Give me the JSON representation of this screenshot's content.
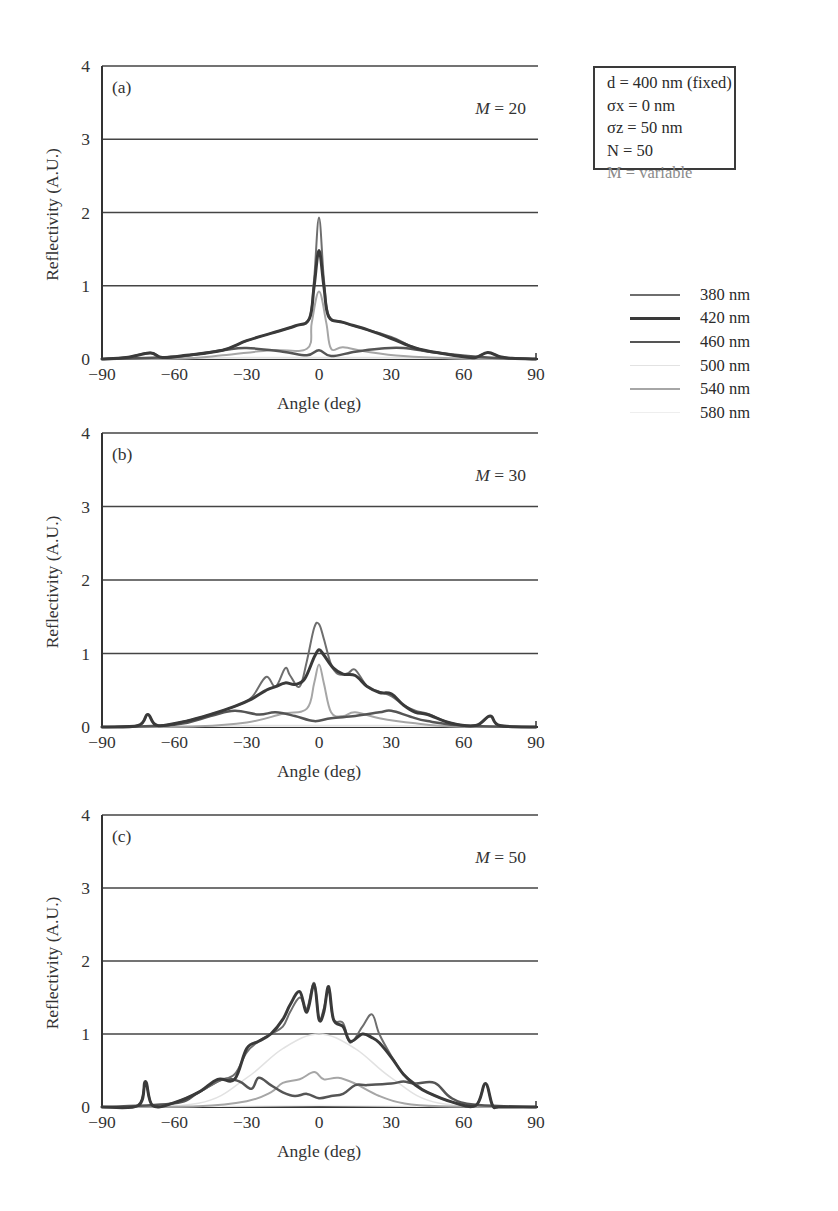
{
  "figure": {
    "parameters": {
      "d": "d = 400 nm (fixed)",
      "sigma_x": "σx = 0 nm",
      "sigma_z": "σz = 50 nm",
      "N": "N = 50",
      "M": "M = variable"
    },
    "legend": [
      {
        "label": "380 nm",
        "color": "#6e6e6e",
        "width": 2
      },
      {
        "label": "420 nm",
        "color": "#3a3a3a",
        "width": 3
      },
      {
        "label": "460 nm",
        "color": "#555555",
        "width": 2.5
      },
      {
        "label": "500 nm",
        "color": "#e2e2e2",
        "width": 1.5
      },
      {
        "label": "540 nm",
        "color": "#a6a6a6",
        "width": 2
      },
      {
        "label": "580 nm",
        "color": "#eeeeee",
        "width": 1.5
      }
    ]
  },
  "chart_data": [
    {
      "type": "line",
      "panel": "(a)",
      "annotation": "M = 20",
      "xlabel": "Angle (deg)",
      "ylabel": "Reflectivity (A.U.)",
      "xlim": [
        -90,
        90
      ],
      "ylim": [
        0,
        4
      ],
      "xticks": [
        -90,
        -60,
        -30,
        0,
        30,
        60,
        90
      ],
      "yticks": [
        0,
        1,
        2,
        3,
        4
      ],
      "grid": "horizontal",
      "series": [
        {
          "name": "380 nm",
          "x": [
            -90,
            -80,
            -70,
            -65,
            -55,
            -40,
            -30,
            -20,
            -10,
            -4,
            -2,
            0,
            2,
            4,
            10,
            20,
            30,
            40,
            50,
            60,
            65,
            70,
            75,
            80,
            90
          ],
          "y": [
            0,
            0.02,
            0.09,
            0.02,
            0.05,
            0.12,
            0.25,
            0.35,
            0.45,
            0.55,
            1.1,
            1.93,
            1.1,
            0.6,
            0.5,
            0.4,
            0.3,
            0.15,
            0.08,
            0.03,
            0.02,
            0.09,
            0.03,
            0.01,
            0
          ]
        },
        {
          "name": "420 nm",
          "x": [
            -90,
            -80,
            -70,
            -65,
            -55,
            -40,
            -30,
            -20,
            -10,
            -4,
            -2,
            0,
            2,
            4,
            10,
            20,
            30,
            40,
            50,
            60,
            65,
            70,
            75,
            80,
            90
          ],
          "y": [
            0,
            0.02,
            0.08,
            0.02,
            0.05,
            0.12,
            0.25,
            0.35,
            0.45,
            0.55,
            1.0,
            1.48,
            1.0,
            0.58,
            0.5,
            0.4,
            0.28,
            0.15,
            0.08,
            0.03,
            0.02,
            0.09,
            0.03,
            0.01,
            0
          ]
        },
        {
          "name": "460 nm",
          "x": [
            -90,
            -60,
            -40,
            -30,
            -15,
            -5,
            0,
            5,
            15,
            25,
            35,
            50,
            70,
            90
          ],
          "y": [
            0,
            0.03,
            0.12,
            0.15,
            0.1,
            0.05,
            0.12,
            0.04,
            0.1,
            0.14,
            0.15,
            0.08,
            0.02,
            0
          ]
        },
        {
          "name": "500 nm",
          "x": [
            -90,
            -50,
            -30,
            0,
            30,
            50,
            90
          ],
          "y": [
            0,
            0.01,
            0.02,
            0.02,
            0.02,
            0.01,
            0
          ]
        },
        {
          "name": "540 nm",
          "x": [
            -90,
            -55,
            -40,
            -20,
            -5,
            -3,
            0,
            3,
            5,
            10,
            20,
            35,
            55,
            90
          ],
          "y": [
            0,
            0.01,
            0.05,
            0.12,
            0.14,
            0.5,
            0.92,
            0.5,
            0.14,
            0.16,
            0.1,
            0.04,
            0.01,
            0
          ]
        },
        {
          "name": "580 nm",
          "x": [
            -90,
            -50,
            0,
            50,
            90
          ],
          "y": [
            0,
            0.01,
            0.01,
            0.01,
            0
          ]
        }
      ]
    },
    {
      "type": "line",
      "panel": "(b)",
      "annotation": "M = 30",
      "xlabel": "Angle (deg)",
      "ylabel": "Reflectivity (A.U.)",
      "xlim": [
        -90,
        90
      ],
      "ylim": [
        0,
        4
      ],
      "xticks": [
        -90,
        -60,
        -30,
        0,
        30,
        60,
        90
      ],
      "yticks": [
        0,
        1,
        2,
        3,
        4
      ],
      "grid": "horizontal",
      "series": [
        {
          "name": "380 nm",
          "x": [
            -90,
            -75,
            -71,
            -67,
            -55,
            -45,
            -35,
            -28,
            -22,
            -18,
            -14,
            -12,
            -8,
            -5,
            -2,
            0,
            2,
            5,
            8,
            12,
            15,
            20,
            25,
            30,
            35,
            40,
            45,
            55,
            65,
            71,
            75,
            90
          ],
          "y": [
            0,
            0.02,
            0.17,
            0.02,
            0.08,
            0.17,
            0.28,
            0.4,
            0.68,
            0.55,
            0.8,
            0.7,
            0.55,
            0.9,
            1.35,
            1.4,
            1.2,
            0.85,
            0.72,
            0.73,
            0.78,
            0.55,
            0.48,
            0.42,
            0.3,
            0.22,
            0.18,
            0.05,
            0.02,
            0.15,
            0.02,
            0
          ]
        },
        {
          "name": "420 nm",
          "x": [
            -90,
            -75,
            -71,
            -67,
            -55,
            -45,
            -35,
            -28,
            -22,
            -18,
            -14,
            -10,
            -6,
            -2,
            0,
            2,
            6,
            10,
            15,
            20,
            25,
            30,
            35,
            40,
            45,
            55,
            65,
            71,
            75,
            90
          ],
          "y": [
            0,
            0.02,
            0.17,
            0.02,
            0.08,
            0.17,
            0.28,
            0.38,
            0.5,
            0.55,
            0.6,
            0.58,
            0.65,
            0.95,
            1.05,
            0.98,
            0.8,
            0.72,
            0.7,
            0.55,
            0.47,
            0.45,
            0.3,
            0.2,
            0.17,
            0.05,
            0.02,
            0.15,
            0.02,
            0
          ]
        },
        {
          "name": "460 nm",
          "x": [
            -90,
            -60,
            -45,
            -35,
            -25,
            -18,
            -10,
            -2,
            5,
            15,
            25,
            30,
            38,
            45,
            60,
            90
          ],
          "y": [
            0,
            0.03,
            0.15,
            0.22,
            0.17,
            0.2,
            0.15,
            0.08,
            0.12,
            0.15,
            0.2,
            0.22,
            0.14,
            0.08,
            0.02,
            0
          ]
        },
        {
          "name": "500 nm",
          "x": [
            -90,
            -50,
            -30,
            0,
            30,
            50,
            90
          ],
          "y": [
            0,
            0.01,
            0.02,
            0.02,
            0.02,
            0.01,
            0
          ]
        },
        {
          "name": "540 nm",
          "x": [
            -90,
            -50,
            -30,
            -15,
            -5,
            -2,
            0,
            2,
            5,
            10,
            15,
            25,
            40,
            55,
            90
          ],
          "y": [
            0,
            0.01,
            0.06,
            0.18,
            0.25,
            0.6,
            0.85,
            0.6,
            0.2,
            0.15,
            0.2,
            0.12,
            0.05,
            0.01,
            0
          ]
        },
        {
          "name": "580 nm",
          "x": [
            -90,
            -50,
            0,
            50,
            90
          ],
          "y": [
            0,
            0.01,
            0.01,
            0.01,
            0
          ]
        }
      ]
    },
    {
      "type": "line",
      "panel": "(c)",
      "annotation": "M = 50",
      "xlabel": "Angle (deg)",
      "ylabel": "Reflectivity (A.U.)",
      "xlim": [
        -90,
        90
      ],
      "ylim": [
        0,
        4
      ],
      "xticks": [
        -90,
        -60,
        -30,
        0,
        30,
        60,
        90
      ],
      "yticks": [
        0,
        1,
        2,
        3,
        4
      ],
      "grid": "horizontal",
      "series": [
        {
          "name": "380 nm",
          "x": [
            -90,
            -75,
            -72,
            -69,
            -60,
            -50,
            -42,
            -35,
            -30,
            -25,
            -20,
            -15,
            -12,
            -8,
            -5,
            -2,
            0,
            2,
            4,
            6,
            10,
            13,
            18,
            22,
            25,
            30,
            35,
            40,
            45,
            55,
            65,
            69,
            72,
            75,
            90
          ],
          "y": [
            0,
            0.02,
            0.35,
            0.02,
            0.06,
            0.2,
            0.35,
            0.45,
            0.75,
            0.9,
            1.0,
            1.1,
            1.3,
            1.5,
            1.35,
            1.7,
            1.2,
            1.35,
            1.6,
            1.2,
            1.15,
            0.88,
            1.1,
            1.27,
            1.0,
            0.7,
            0.45,
            0.32,
            0.2,
            0.07,
            0.02,
            0.32,
            0.02,
            0,
            0
          ]
        },
        {
          "name": "420 nm",
          "x": [
            -90,
            -75,
            -72,
            -69,
            -60,
            -50,
            -42,
            -35,
            -30,
            -25,
            -20,
            -15,
            -12,
            -8,
            -5,
            -2,
            0,
            2,
            4,
            6,
            10,
            13,
            18,
            22,
            25,
            30,
            35,
            40,
            45,
            55,
            65,
            69,
            72,
            75,
            90
          ],
          "y": [
            0,
            0.02,
            0.35,
            0.02,
            0.06,
            0.2,
            0.38,
            0.38,
            0.8,
            0.9,
            1.0,
            1.2,
            1.4,
            1.58,
            1.3,
            1.68,
            1.2,
            1.3,
            1.65,
            1.2,
            1.1,
            0.9,
            1.0,
            0.95,
            0.88,
            0.68,
            0.45,
            0.3,
            0.2,
            0.07,
            0.02,
            0.32,
            0.02,
            0,
            0
          ]
        },
        {
          "name": "460 nm",
          "x": [
            -90,
            -60,
            -50,
            -40,
            -33,
            -28,
            -25,
            -20,
            -15,
            -10,
            -5,
            0,
            5,
            10,
            15,
            20,
            30,
            35,
            40,
            48,
            55,
            65,
            90
          ],
          "y": [
            0,
            0.05,
            0.2,
            0.38,
            0.35,
            0.25,
            0.4,
            0.3,
            0.2,
            0.15,
            0.18,
            0.12,
            0.15,
            0.18,
            0.3,
            0.3,
            0.32,
            0.35,
            0.32,
            0.33,
            0.12,
            0.03,
            0
          ]
        },
        {
          "name": "500 nm",
          "x": [
            -90,
            -50,
            -30,
            -15,
            0,
            15,
            30,
            50,
            90
          ],
          "y": [
            0,
            0.05,
            0.4,
            0.8,
            1.0,
            0.8,
            0.4,
            0.05,
            0
          ]
        },
        {
          "name": "540 nm",
          "x": [
            -90,
            -50,
            -30,
            -20,
            -15,
            -8,
            -2,
            2,
            8,
            15,
            25,
            35,
            50,
            90
          ],
          "y": [
            0,
            0.01,
            0.08,
            0.2,
            0.33,
            0.38,
            0.48,
            0.38,
            0.4,
            0.32,
            0.15,
            0.05,
            0.01,
            0
          ]
        },
        {
          "name": "580 nm",
          "x": [
            -90,
            -50,
            0,
            50,
            90
          ],
          "y": [
            0,
            0.01,
            0.02,
            0.01,
            0
          ]
        }
      ]
    }
  ]
}
